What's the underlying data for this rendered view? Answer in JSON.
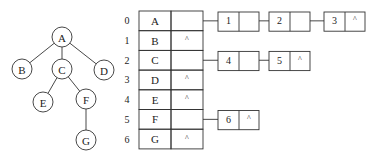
{
  "tree": {
    "nodes": [
      {
        "id": "A",
        "label": "A",
        "cx": 62,
        "cy": 37
      },
      {
        "id": "B",
        "label": "B",
        "cx": 22,
        "cy": 69
      },
      {
        "id": "C",
        "label": "C",
        "cx": 62,
        "cy": 69
      },
      {
        "id": "D",
        "label": "D",
        "cx": 104,
        "cy": 70
      },
      {
        "id": "E",
        "label": "E",
        "cx": 43,
        "cy": 102
      },
      {
        "id": "F",
        "label": "F",
        "cx": 86,
        "cy": 99
      },
      {
        "id": "G",
        "label": "G",
        "cx": 86,
        "cy": 140
      }
    ],
    "edges": [
      [
        "A",
        "B"
      ],
      [
        "A",
        "C"
      ],
      [
        "A",
        "D"
      ],
      [
        "C",
        "E"
      ],
      [
        "C",
        "F"
      ],
      [
        "F",
        "G"
      ]
    ],
    "radius": 10
  },
  "table": {
    "rows": [
      {
        "index": "0",
        "data": "A",
        "link": "",
        "children": [
          "1",
          "2",
          "3"
        ]
      },
      {
        "index": "1",
        "data": "B",
        "link": "^",
        "children": []
      },
      {
        "index": "2",
        "data": "C",
        "link": "",
        "children": [
          "4",
          "5"
        ]
      },
      {
        "index": "3",
        "data": "D",
        "link": "^",
        "children": []
      },
      {
        "index": "4",
        "data": "E",
        "link": "^",
        "children": []
      },
      {
        "index": "5",
        "data": "F",
        "link": "",
        "children": [
          "6"
        ]
      },
      {
        "index": "6",
        "data": "G",
        "link": "^",
        "children": []
      }
    ],
    "null_symbol": "^"
  },
  "colors": {
    "stroke": "#333333",
    "text": "#222222",
    "background": "#ffffff"
  }
}
